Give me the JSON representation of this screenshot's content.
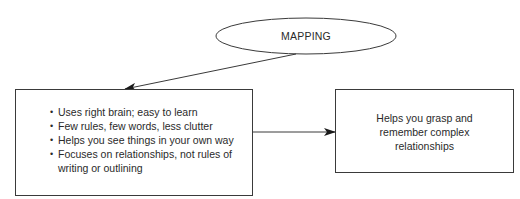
{
  "diagram": {
    "root": {
      "label": "MAPPING",
      "shape": "ellipse"
    },
    "characteristics_box": {
      "bullet_symbol": "•",
      "items": [
        "Uses right brain; easy to learn",
        "Few rules, few words, less clutter",
        "Helps you see things in your own way",
        "Focuses on relationships, not rules of\nwriting or outlining"
      ]
    },
    "outcome_box": {
      "text": "Helps you grasp and\nremember complex\nrelationships"
    },
    "edges": [
      {
        "from": "root",
        "to": "characteristics_box",
        "type": "arrow"
      },
      {
        "from": "characteristics_box",
        "to": "outcome_box",
        "type": "arrow"
      }
    ],
    "colors": {
      "stroke": "#3a3a3a",
      "text": "#2a2a2a",
      "background": "#ffffff"
    }
  }
}
